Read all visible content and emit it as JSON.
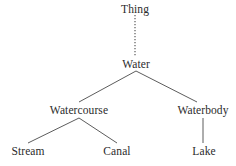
{
  "diagram": {
    "type": "tree",
    "background_color": "#ffffff",
    "text_color": "#2b2b2b",
    "edge_color": "#4a4a4a",
    "nodes": [
      {
        "id": "thing",
        "label": "Thing",
        "x": 135,
        "y": 9,
        "level": 0
      },
      {
        "id": "water",
        "label": "Water",
        "x": 136,
        "y": 64,
        "level": 1
      },
      {
        "id": "watercourse",
        "label": "Watercourse",
        "x": 79,
        "y": 110,
        "level": 2
      },
      {
        "id": "waterbody",
        "label": "Waterbody",
        "x": 203,
        "y": 110,
        "level": 2
      },
      {
        "id": "stream",
        "label": "Stream",
        "x": 28,
        "y": 151,
        "level": 3
      },
      {
        "id": "canal",
        "label": "Canal",
        "x": 117,
        "y": 151,
        "level": 3
      },
      {
        "id": "lake",
        "label": "Lake",
        "x": 204,
        "y": 151,
        "level": 3
      }
    ],
    "edges": [
      {
        "id": "thing-water",
        "from": "thing",
        "to": "water",
        "style": "dotted",
        "x1": 135,
        "y1": 15,
        "x2": 135,
        "y2": 57
      },
      {
        "id": "water-watercourse",
        "from": "water",
        "to": "watercourse",
        "style": "solid",
        "x1": 136,
        "y1": 71,
        "x2": 79,
        "y2": 102
      },
      {
        "id": "water-waterbody",
        "from": "water",
        "to": "waterbody",
        "style": "solid",
        "x1": 136,
        "y1": 71,
        "x2": 197,
        "y2": 102
      },
      {
        "id": "watercourse-stream",
        "from": "watercourse",
        "to": "stream",
        "style": "solid",
        "x1": 79,
        "y1": 118,
        "x2": 28,
        "y2": 143
      },
      {
        "id": "watercourse-canal",
        "from": "watercourse",
        "to": "canal",
        "style": "solid",
        "x1": 79,
        "y1": 118,
        "x2": 117,
        "y2": 143
      },
      {
        "id": "waterbody-lake",
        "from": "waterbody",
        "to": "lake",
        "style": "solid",
        "x1": 203,
        "y1": 118,
        "x2": 203,
        "y2": 143
      }
    ]
  }
}
